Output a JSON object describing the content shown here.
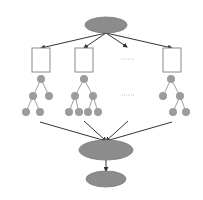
{
  "diagram": {
    "type": "hierarchical-aggregation",
    "colors": {
      "ellipse_fill": "#8c8c8c",
      "ellipse_stroke": "#7a7a7a",
      "node_fill": "#9c9c9c",
      "box_stroke": "#8a8a8a",
      "edge": "#333333",
      "tree_edge": "#888888",
      "dots": "#999999"
    },
    "top_ellipse": {
      "cx": 106,
      "cy": 25,
      "rx": 21,
      "ry": 8
    },
    "boxes": [
      {
        "x": 32,
        "y": 48,
        "w": 18,
        "h": 24
      },
      {
        "x": 75,
        "y": 48,
        "w": 18,
        "h": 24
      },
      {
        "x": 163,
        "y": 48,
        "w": 18,
        "h": 24
      }
    ],
    "top_arrows": [
      {
        "x1": 106,
        "y1": 33,
        "x2": 41,
        "y2": 48
      },
      {
        "x1": 106,
        "y1": 33,
        "x2": 84,
        "y2": 48
      },
      {
        "x1": 106,
        "y1": 33,
        "x2": 127,
        "y2": 47
      },
      {
        "x1": 106,
        "y1": 33,
        "x2": 172,
        "y2": 48
      }
    ],
    "ellipsis_rows": [
      {
        "x": 122,
        "y": 59,
        "count": 6,
        "gap": 2.3
      },
      {
        "x": 122,
        "y": 95,
        "count": 6,
        "gap": 2.3
      }
    ],
    "trees": [
      {
        "nodes": [
          [
            41,
            79
          ],
          [
            33,
            96
          ],
          [
            49,
            96
          ],
          [
            26,
            112
          ],
          [
            40,
            112
          ]
        ],
        "edges": [
          [
            0,
            1
          ],
          [
            0,
            2
          ],
          [
            1,
            3
          ],
          [
            1,
            4
          ]
        ]
      },
      {
        "nodes": [
          [
            84,
            79
          ],
          [
            75,
            96
          ],
          [
            93,
            96
          ],
          [
            69,
            112
          ],
          [
            79,
            112
          ],
          [
            88,
            112
          ],
          [
            98,
            112
          ]
        ],
        "edges": [
          [
            0,
            1
          ],
          [
            0,
            2
          ],
          [
            1,
            3
          ],
          [
            1,
            4
          ],
          [
            2,
            5
          ],
          [
            2,
            6
          ]
        ]
      },
      {
        "nodes": [
          [
            171,
            79
          ],
          [
            163,
            96
          ],
          [
            180,
            96
          ],
          [
            173,
            112
          ],
          [
            186,
            112
          ]
        ],
        "edges": [
          [
            0,
            1
          ],
          [
            0,
            2
          ],
          [
            2,
            3
          ],
          [
            2,
            4
          ]
        ]
      }
    ],
    "node_radius": 4,
    "converge_arrows": [
      {
        "x1": 40,
        "y1": 122,
        "x2": 106,
        "y2": 141
      },
      {
        "x1": 84,
        "y1": 121,
        "x2": 106,
        "y2": 141
      },
      {
        "x1": 128,
        "y1": 121,
        "x2": 106,
        "y2": 141
      },
      {
        "x1": 172,
        "y1": 122,
        "x2": 106,
        "y2": 141
      }
    ],
    "middle_ellipse": {
      "cx": 106,
      "cy": 150,
      "rx": 27,
      "ry": 10
    },
    "down_arrow": {
      "x1": 106,
      "y1": 160,
      "x2": 106,
      "y2": 171
    },
    "bottom_ellipse": {
      "cx": 106,
      "cy": 179,
      "rx": 20,
      "ry": 8
    }
  }
}
